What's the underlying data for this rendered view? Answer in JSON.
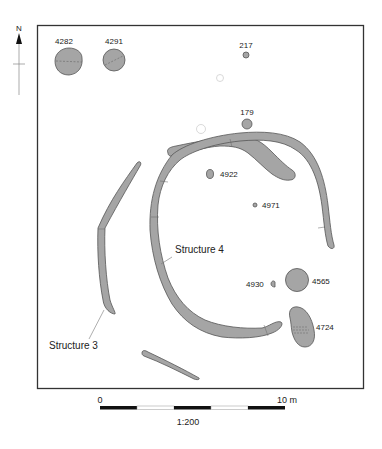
{
  "plan": {
    "north_label": "N",
    "features": [
      {
        "id": "4282",
        "label": "4282",
        "type": "pit"
      },
      {
        "id": "4291",
        "label": "4291",
        "type": "pit"
      },
      {
        "id": "217",
        "label": "217",
        "type": "posthole"
      },
      {
        "id": "179",
        "label": "179",
        "type": "posthole"
      },
      {
        "id": "4922",
        "label": "4922",
        "type": "posthole"
      },
      {
        "id": "4971",
        "label": "4971",
        "type": "posthole"
      },
      {
        "id": "4930",
        "label": "4930",
        "type": "posthole"
      },
      {
        "id": "4565",
        "label": "4565",
        "type": "pit"
      },
      {
        "id": "4724",
        "label": "4724",
        "type": "pit"
      }
    ],
    "structures": [
      {
        "id": "structure-4",
        "label": "Structure 4"
      },
      {
        "id": "structure-3",
        "label": "Structure 3"
      }
    ],
    "colors": {
      "feature_fill": "#a5a5a5",
      "feature_stroke": "#555555",
      "frame": "#333333"
    }
  },
  "scale_bar": {
    "start_label": "0",
    "end_label": "10 m",
    "ratio_label": "1:200",
    "segments": 5
  }
}
